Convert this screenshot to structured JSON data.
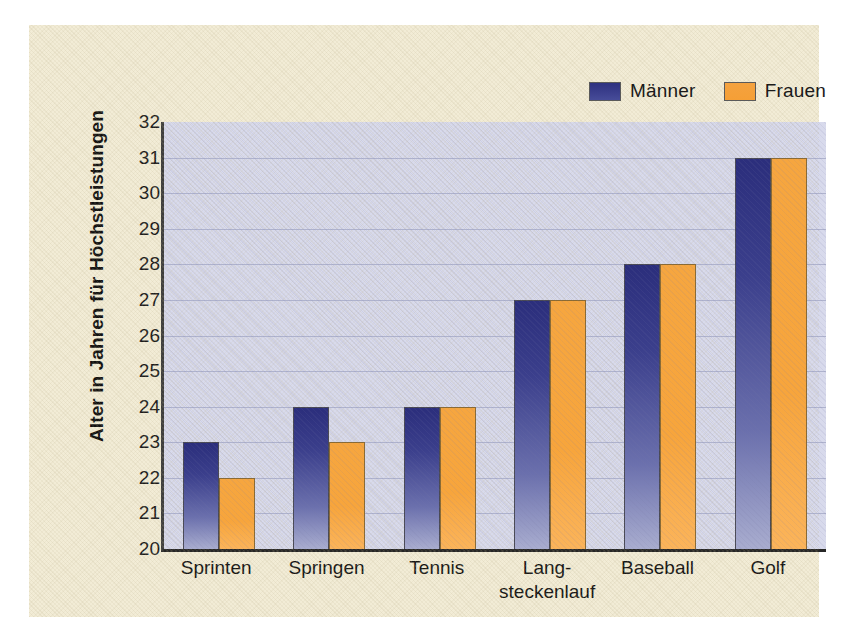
{
  "legend": {
    "position": "top-right",
    "entries": [
      {
        "label": "Männer",
        "color": "#3b3f8c",
        "icon": "legend-swatch-icon"
      },
      {
        "label": "Frauen",
        "color": "#f6a63f",
        "icon": "legend-swatch-icon"
      }
    ]
  },
  "chart_data": {
    "type": "bar",
    "title": "",
    "subtitle": "",
    "xlabel": "",
    "ylabel": "Alter in Jahren für Höchstleistungen",
    "ylim": [
      20,
      32
    ],
    "ytick_step": 1,
    "yticks": [
      32,
      31,
      30,
      29,
      28,
      27,
      26,
      25,
      24,
      23,
      22,
      21,
      20
    ],
    "grid": true,
    "grid_axis": "y",
    "legend_position": "top-right",
    "categories": [
      "Sprinten",
      "Springen",
      "Tennis",
      "Lang-steckenlauf",
      "Baseball",
      "Golf"
    ],
    "category_lines": [
      [
        "Sprinten"
      ],
      [
        "Springen"
      ],
      [
        "Tennis"
      ],
      [
        "Lang-",
        "steckenlauf"
      ],
      [
        "Baseball"
      ],
      [
        "Golf"
      ]
    ],
    "series": [
      {
        "name": "Männer",
        "color": "#3b3f8c",
        "values": [
          23,
          24,
          24,
          27,
          28,
          31
        ]
      },
      {
        "name": "Frauen",
        "color": "#f6a63f",
        "values": [
          22,
          23,
          24,
          27,
          28,
          31
        ]
      }
    ]
  },
  "colors": {
    "page_background": "#ffffff",
    "panel_background": "#f2ecd6",
    "plot_background": "#d8daec",
    "gridline": "#aeb2cd",
    "axis": "#2d2d2d",
    "series_maenner": "#3b3f8c",
    "series_frauen": "#f6a63f"
  }
}
